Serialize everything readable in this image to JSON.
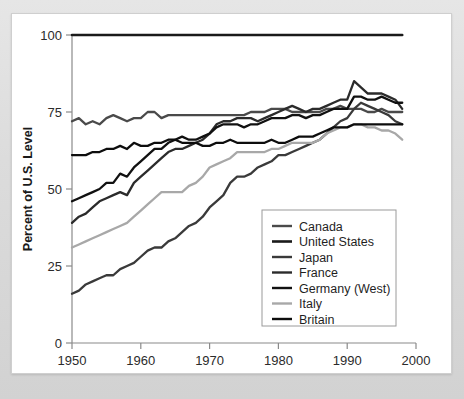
{
  "chart_data": {
    "type": "line",
    "title": "",
    "xlabel": "Year",
    "ylabel": "Percent of U.S. Level",
    "xlim": [
      1950,
      2000
    ],
    "ylim": [
      0,
      100
    ],
    "xticks": [
      1950,
      1960,
      1970,
      1980,
      1990,
      2000
    ],
    "yticks": [
      0,
      25,
      50,
      75,
      100
    ],
    "grid": false,
    "legend_position": "inside-lower-right",
    "x": [
      1950,
      1951,
      1952,
      1953,
      1954,
      1955,
      1956,
      1957,
      1958,
      1959,
      1960,
      1961,
      1962,
      1963,
      1964,
      1965,
      1966,
      1967,
      1968,
      1969,
      1970,
      1971,
      1972,
      1973,
      1974,
      1975,
      1976,
      1977,
      1978,
      1979,
      1980,
      1981,
      1982,
      1983,
      1984,
      1985,
      1986,
      1987,
      1988,
      1989,
      1990,
      1991,
      1992,
      1993,
      1994,
      1995,
      1996,
      1997,
      1998
    ],
    "series": [
      {
        "name": "United States",
        "color": "#1a1a1a",
        "width": 2.6,
        "values": [
          100,
          100,
          100,
          100,
          100,
          100,
          100,
          100,
          100,
          100,
          100,
          100,
          100,
          100,
          100,
          100,
          100,
          100,
          100,
          100,
          100,
          100,
          100,
          100,
          100,
          100,
          100,
          100,
          100,
          100,
          100,
          100,
          100,
          100,
          100,
          100,
          100,
          100,
          100,
          100,
          100,
          100,
          100,
          100,
          100,
          100,
          100,
          100,
          100
        ]
      },
      {
        "name": "Canada",
        "color": "#4a4a4a",
        "width": 2.3,
        "values": [
          72,
          73,
          71,
          72,
          71,
          73,
          74,
          73,
          72,
          73,
          73,
          75,
          75,
          73,
          74,
          74,
          74,
          74,
          74,
          74,
          74,
          74,
          74,
          74,
          74,
          74,
          75,
          75,
          75,
          76,
          76,
          76,
          75,
          75,
          75,
          75,
          75,
          76,
          76,
          77,
          76,
          76,
          76,
          75,
          75,
          76,
          75,
          75,
          75
        ]
      },
      {
        "name": "Japan",
        "color": "#3a3a3a",
        "width": 2.3,
        "values": [
          16,
          17,
          19,
          20,
          21,
          22,
          22,
          24,
          25,
          26,
          28,
          30,
          31,
          31,
          33,
          34,
          36,
          38,
          39,
          41,
          44,
          46,
          48,
          52,
          54,
          54,
          55,
          57,
          58,
          59,
          61,
          61,
          62,
          63,
          64,
          65,
          66,
          68,
          70,
          72,
          73,
          76,
          78,
          77,
          76,
          75,
          74,
          72,
          71
        ]
      },
      {
        "name": "France",
        "color": "#2b2b2b",
        "width": 2.3,
        "values": [
          39,
          41,
          42,
          44,
          46,
          47,
          48,
          49,
          48,
          52,
          54,
          56,
          58,
          60,
          62,
          63,
          63,
          64,
          65,
          66,
          68,
          71,
          72,
          72,
          73,
          73,
          73,
          72,
          73,
          74,
          75,
          76,
          77,
          76,
          75,
          76,
          76,
          77,
          78,
          79,
          79,
          85,
          83,
          81,
          81,
          81,
          80,
          79,
          76
        ]
      },
      {
        "name": "Germany (West)",
        "color": "#111111",
        "width": 2.3,
        "values": [
          46,
          47,
          48,
          49,
          50,
          52,
          52,
          55,
          54,
          57,
          59,
          61,
          63,
          63,
          65,
          66,
          67,
          66,
          66,
          67,
          68,
          70,
          71,
          71,
          71,
          70,
          71,
          71,
          72,
          73,
          73,
          73,
          74,
          74,
          73,
          74,
          74,
          75,
          76,
          76,
          76,
          80,
          80,
          79,
          79,
          80,
          79,
          78,
          78
        ]
      },
      {
        "name": "Italy",
        "color": "#a8a8a8",
        "width": 2.3,
        "values": [
          31,
          32,
          33,
          34,
          35,
          36,
          37,
          38,
          39,
          41,
          43,
          45,
          47,
          49,
          49,
          49,
          49,
          51,
          52,
          54,
          57,
          58,
          59,
          60,
          62,
          62,
          62,
          62,
          62,
          63,
          63,
          64,
          65,
          65,
          65,
          65,
          66,
          68,
          69,
          70,
          70,
          71,
          71,
          70,
          70,
          69,
          69,
          68,
          66
        ]
      },
      {
        "name": "Britain",
        "color": "#0d0d0d",
        "width": 2.3,
        "values": [
          61,
          61,
          61,
          62,
          62,
          63,
          63,
          64,
          63,
          65,
          64,
          64,
          65,
          65,
          66,
          66,
          65,
          65,
          65,
          64,
          64,
          65,
          65,
          66,
          65,
          65,
          65,
          65,
          65,
          66,
          65,
          65,
          66,
          67,
          67,
          67,
          68,
          69,
          70,
          70,
          70,
          71,
          71,
          71,
          71,
          71,
          71,
          71,
          71
        ]
      }
    ]
  },
  "legend": {
    "items": [
      {
        "label": "Canada"
      },
      {
        "label": "United States"
      },
      {
        "label": "Japan"
      },
      {
        "label": "France"
      },
      {
        "label": "Germany (West)"
      },
      {
        "label": "Italy"
      },
      {
        "label": "Britain"
      }
    ]
  },
  "axes": {
    "y_label": "Percent of U.S. Level",
    "x_label": "Year",
    "y_tick_labels": [
      "0",
      "25",
      "50",
      "75",
      "100"
    ],
    "x_tick_labels": [
      "1950",
      "1960",
      "1970",
      "1980",
      "1990",
      "2000"
    ]
  },
  "colors": {
    "page_background": "#dcdcdc",
    "card_background": "#ffffff",
    "axis": "#8a8a8a",
    "text": "#1f1f1f"
  }
}
